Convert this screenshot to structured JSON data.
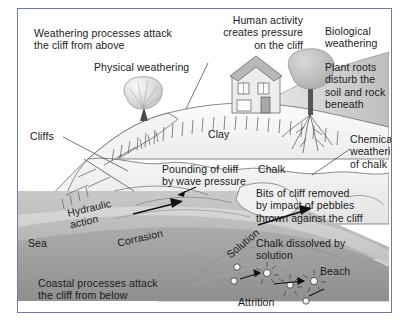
{
  "diagram": {
    "frame_border_color": "#6f7aa0",
    "background_color": "#ffffff",
    "text_color": "#1a1a1a"
  },
  "labels": {
    "weathering_above": "Weathering processes attack\nthe cliff from above",
    "physical_weathering": "Physical weathering",
    "human_activity": "Human activity\ncreates pressure\non the cliff",
    "biological_weathering": "Biological\nweathering",
    "plant_roots": "Plant roots\ndisturb the\nsoil and rock\nbeneath",
    "cliffs": "Cliffs",
    "clay": "Clay",
    "chemical_weathering": "Chemical\nweathering\nof chalk",
    "pounding": "Pounding of cliff\nby wave pressure",
    "chalk": "Chalk",
    "bits_of_cliff": "Bits of cliff removed\nby impact of pebbles\nthrown against the cliff",
    "hydraulic_action": "Hydraulic\naction",
    "corrasion": "Corrasion",
    "solution": "Solution",
    "chalk_dissolved": "Chalk dissolved by\nsolution",
    "sea": "Sea",
    "beach": "Beach",
    "coastal_below": "Coastal processes attack\nthe cliff from below",
    "attrition": "Attrition"
  },
  "icons": {
    "house": "house-icon",
    "tree_left": "tree-icon",
    "tree_right": "tree-with-roots-icon",
    "arrow_hydraulic": "arrow-icon",
    "arrow_corrasion": "arrow-icon",
    "arrow_solution": "arrow-icon",
    "arrow_pounding": "arrow-icon",
    "pebbles": "pebble-collision-icon"
  },
  "colors": {
    "sky": "#ffffff",
    "clay": "#f2f2f2",
    "chalk": "#efefef",
    "sea_far": "#bcbcbc",
    "sea_near": "#9d9d9d",
    "sea_mid": "#cfcfcf",
    "beach": "#d6d6d6",
    "line": "#5b5b5b",
    "arrow": "#111111"
  }
}
